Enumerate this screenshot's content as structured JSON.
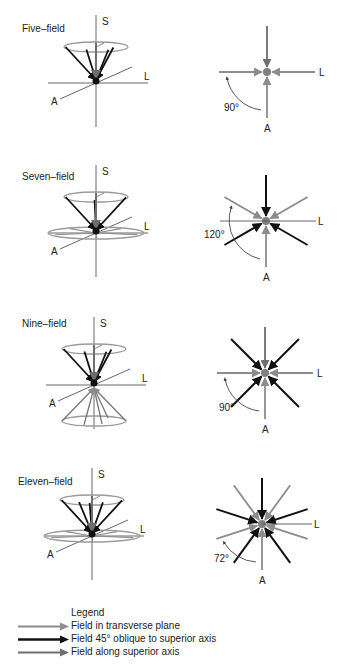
{
  "colors": {
    "transverse": "#8c8c8c",
    "oblique": "#111111",
    "superior": "#6e6e6e",
    "axis": "#666666",
    "ellipse": "#9a9a9a"
  },
  "panels": [
    {
      "title": "Five–field",
      "axis_labels": {
        "s": "S",
        "l": "L",
        "a": "A"
      },
      "angle_label": "90°",
      "left_origin": [
        96,
        83
      ],
      "right_center": [
        267,
        72
      ],
      "title_pos": [
        22,
        32
      ],
      "top_cone": {
        "rx": 32,
        "ry": 5,
        "h": 36,
        "n_oblique": 4,
        "superior": true
      },
      "bottom_cone": null,
      "transverse_ellipse": null,
      "right_arrows": [
        {
          "angle": 90,
          "type": "superior",
          "len": 46
        },
        {
          "angle": 0,
          "type": "transverse",
          "len": 48
        },
        {
          "angle": 180,
          "type": "transverse",
          "len": 48
        },
        {
          "angle": 270,
          "type": "transverse",
          "len": 46
        }
      ],
      "arc": {
        "r": 40,
        "from": 180,
        "to": 270,
        "label_pos": [
          224,
          111
        ]
      }
    },
    {
      "title": "Seven–field",
      "axis_labels": {
        "s": "S",
        "l": "L",
        "a": "A"
      },
      "angle_label": "120°",
      "left_origin": [
        96,
        233
      ],
      "right_center": [
        266,
        221
      ],
      "title_pos": [
        22,
        180
      ],
      "top_cone": {
        "rx": 32,
        "ry": 5,
        "h": 36,
        "n_oblique": 3,
        "superior": true
      },
      "bottom_cone": null,
      "transverse_ellipse": {
        "rx": 48,
        "ry": 6
      },
      "right_arrows": [
        {
          "angle": 90,
          "type": "oblique",
          "len": 46
        },
        {
          "angle": 30,
          "type": "transverse",
          "len": 48
        },
        {
          "angle": 150,
          "type": "transverse",
          "len": 48
        },
        {
          "angle": 210,
          "type": "oblique",
          "len": 48
        },
        {
          "angle": 330,
          "type": "oblique",
          "len": 48
        },
        {
          "angle": 270,
          "type": "transverse",
          "len": 46
        },
        {
          "angle": 0,
          "type": "axis",
          "len": 50
        },
        {
          "angle": 180,
          "type": "axis",
          "len": 46
        }
      ],
      "arc": {
        "r": 40,
        "from": 150,
        "to": 270,
        "label_pos": [
          204,
          238
        ]
      }
    },
    {
      "title": "Nine–field",
      "axis_labels": {
        "s": "S",
        "l": "L",
        "a": "A"
      },
      "angle_label": "90°",
      "left_origin": [
        94,
        385
      ],
      "right_center": [
        265,
        373
      ],
      "title_pos": [
        22,
        327
      ],
      "top_cone": {
        "rx": 32,
        "ry": 5,
        "h": 36,
        "n_oblique": 4,
        "superior": true
      },
      "bottom_cone": {
        "rx": 32,
        "ry": 5,
        "h": 36,
        "n": 4
      },
      "transverse_ellipse": null,
      "right_arrows": [
        {
          "angle": 90,
          "type": "superior",
          "len": 46
        },
        {
          "angle": 0,
          "type": "transverse",
          "len": 48
        },
        {
          "angle": 180,
          "type": "transverse",
          "len": 48
        },
        {
          "angle": 270,
          "type": "transverse",
          "len": 46
        },
        {
          "angle": 45,
          "type": "oblique",
          "len": 48
        },
        {
          "angle": 135,
          "type": "oblique",
          "len": 48
        },
        {
          "angle": 225,
          "type": "oblique",
          "len": 48
        },
        {
          "angle": 315,
          "type": "oblique",
          "len": 48
        }
      ],
      "arc": {
        "r": 40,
        "from": 180,
        "to": 270,
        "label_pos": [
          219,
          411
        ]
      }
    },
    {
      "title": "Eleven–field",
      "axis_labels": {
        "s": "S",
        "l": "L",
        "a": "A"
      },
      "angle_label": "72°",
      "left_origin": [
        92,
        536
      ],
      "right_center": [
        262,
        524
      ],
      "title_pos": [
        18,
        485
      ],
      "top_cone": {
        "rx": 32,
        "ry": 5,
        "h": 36,
        "n_oblique": 5,
        "superior": true
      },
      "bottom_cone": null,
      "transverse_ellipse": {
        "rx": 48,
        "ry": 6
      },
      "right_arrows": [
        {
          "angle": 90,
          "type": "oblique",
          "len": 46
        },
        {
          "angle": 18,
          "type": "oblique",
          "len": 48
        },
        {
          "angle": 162,
          "type": "oblique",
          "len": 48
        },
        {
          "angle": 234,
          "type": "oblique",
          "len": 48
        },
        {
          "angle": 306,
          "type": "oblique",
          "len": 48
        },
        {
          "angle": 54,
          "type": "transverse",
          "len": 48
        },
        {
          "angle": 126,
          "type": "transverse",
          "len": 48
        },
        {
          "angle": 198,
          "type": "transverse",
          "len": 48
        },
        {
          "angle": 342,
          "type": "transverse",
          "len": 48
        },
        {
          "angle": 270,
          "type": "transverse",
          "len": 46
        },
        {
          "angle": 0,
          "type": "axis",
          "len": 50
        }
      ],
      "arc": {
        "r": 40,
        "from": 198,
        "to": 270,
        "label_pos": [
          214,
          562
        ]
      }
    }
  ],
  "legend": {
    "title": "Legend",
    "items": [
      {
        "label": "Field in transverse plane",
        "type": "transverse"
      },
      {
        "label": "Field 45° oblique to superior axis",
        "type": "oblique"
      },
      {
        "label": "Field along superior axis",
        "type": "superior"
      }
    ]
  }
}
